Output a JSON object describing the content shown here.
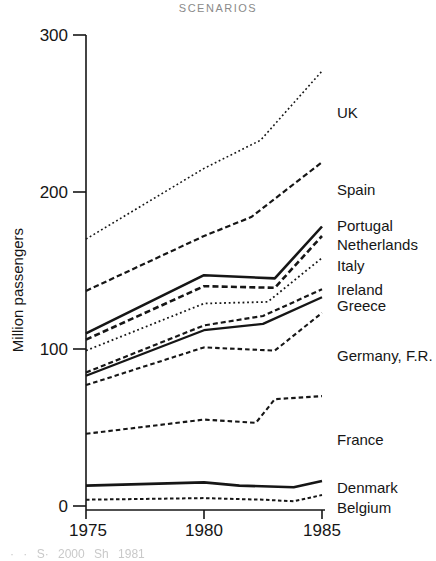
{
  "title": "SCENARIOS",
  "y_axis": {
    "label": "Million passengers",
    "ticks": [
      "300",
      "200",
      "100",
      "0"
    ]
  },
  "x_axis": {
    "ticks": [
      "1975",
      "1980",
      "1985"
    ]
  },
  "footnote_fragment": "· ·  S·  2000 Sh  1981",
  "colors": {
    "line": "#161616",
    "axis": "#161616",
    "title_gray": "#8a8a8a"
  },
  "chart_data": {
    "type": "line",
    "title": "SCENARIOS",
    "xlabel": "",
    "ylabel": "Million passengers",
    "x_range": [
      1975,
      1985
    ],
    "ylim": [
      0,
      300
    ],
    "x_ticks": [
      1975,
      1980,
      1985
    ],
    "y_ticks": [
      0,
      100,
      200,
      300
    ],
    "grid": false,
    "legend_position": "labels-right-of-line-ends",
    "series": [
      {
        "name": "UK",
        "line_style": "dotted",
        "points": [
          [
            1975,
            170
          ],
          [
            1980,
            215
          ],
          [
            1982.4,
            233
          ],
          [
            1985,
            277
          ]
        ]
      },
      {
        "name": "Spain",
        "line_style": "dashed",
        "points": [
          [
            1975,
            137
          ],
          [
            1980,
            172
          ],
          [
            1982,
            184
          ],
          [
            1985,
            219
          ]
        ]
      },
      {
        "name": "Portugal",
        "line_style": "solid",
        "points": [
          [
            1975,
            110
          ],
          [
            1980,
            147
          ],
          [
            1983,
            145
          ],
          [
            1985,
            178
          ]
        ]
      },
      {
        "name": "Netherlands",
        "line_style": "dashed",
        "points": [
          [
            1975,
            106
          ],
          [
            1980,
            140
          ],
          [
            1983,
            139
          ],
          [
            1985,
            172
          ]
        ]
      },
      {
        "name": "Italy",
        "line_style": "dotted",
        "points": [
          [
            1975,
            99
          ],
          [
            1980,
            129
          ],
          [
            1982.7,
            130
          ],
          [
            1985,
            158
          ]
        ]
      },
      {
        "name": "Ireland",
        "line_style": "dashed",
        "points": [
          [
            1975,
            85
          ],
          [
            1980,
            115
          ],
          [
            1982.5,
            121
          ],
          [
            1985,
            138
          ]
        ]
      },
      {
        "name": "Greece",
        "line_style": "solid",
        "points": [
          [
            1975,
            83
          ],
          [
            1980,
            112
          ],
          [
            1982.5,
            116
          ],
          [
            1985,
            133
          ]
        ]
      },
      {
        "name": "Germany, F.R.",
        "line_style": "dashed",
        "points": [
          [
            1975,
            77
          ],
          [
            1980,
            101
          ],
          [
            1983,
            99
          ],
          [
            1985,
            123
          ]
        ]
      },
      {
        "name": "France",
        "line_style": "dashed",
        "points": [
          [
            1975,
            46
          ],
          [
            1980,
            55
          ],
          [
            1982.2,
            53
          ],
          [
            1983,
            68
          ],
          [
            1985,
            70
          ]
        ]
      },
      {
        "name": "Denmark",
        "line_style": "solid",
        "points": [
          [
            1975,
            13
          ],
          [
            1980,
            15
          ],
          [
            1981.5,
            13
          ],
          [
            1983.8,
            12
          ],
          [
            1985,
            16
          ]
        ]
      },
      {
        "name": "Belgium",
        "line_style": "dashed",
        "points": [
          [
            1975,
            4
          ],
          [
            1980,
            5
          ],
          [
            1982.5,
            4
          ],
          [
            1983.8,
            3
          ],
          [
            1985,
            7
          ]
        ]
      }
    ]
  }
}
